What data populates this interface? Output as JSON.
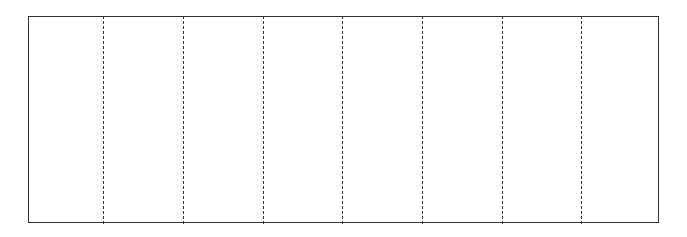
{
  "diagram": {
    "type": "folding-template",
    "panels": 8,
    "fold_lines": [
      103,
      183,
      263,
      342,
      422,
      502,
      581
    ],
    "frame": {
      "left": 28,
      "top": 16,
      "right": 659,
      "bottom": 223
    },
    "stroke_color": "#333333"
  }
}
